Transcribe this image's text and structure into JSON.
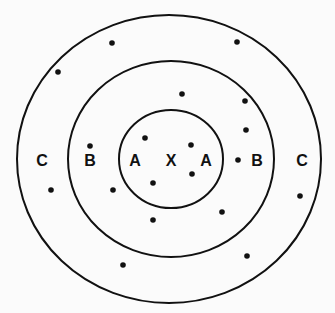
{
  "diagram": {
    "type": "concentric-zones",
    "stroke_color": "#111111",
    "background": "#fbfbfb",
    "rings": [
      {
        "name": "outer",
        "cx": 169,
        "cy": 159,
        "rx": 152,
        "ry": 144
      },
      {
        "name": "middle",
        "cx": 171,
        "cy": 159,
        "rx": 103,
        "ry": 98
      },
      {
        "name": "inner",
        "cx": 171,
        "cy": 159,
        "rx": 52,
        "ry": 49
      }
    ],
    "labels": [
      {
        "text": "C",
        "x": 42,
        "y": 160
      },
      {
        "text": "B",
        "x": 90,
        "y": 160
      },
      {
        "text": "A",
        "x": 135,
        "y": 160
      },
      {
        "text": "X",
        "x": 171,
        "y": 160
      },
      {
        "text": "A",
        "x": 206,
        "y": 160
      },
      {
        "text": "B",
        "x": 257,
        "y": 160
      },
      {
        "text": "C",
        "x": 302,
        "y": 160
      }
    ],
    "dots": [
      {
        "x": 112,
        "y": 43
      },
      {
        "x": 58,
        "y": 72
      },
      {
        "x": 237,
        "y": 42
      },
      {
        "x": 182,
        "y": 94
      },
      {
        "x": 245,
        "y": 101
      },
      {
        "x": 246,
        "y": 130
      },
      {
        "x": 145,
        "y": 138
      },
      {
        "x": 191,
        "y": 145
      },
      {
        "x": 90,
        "y": 146
      },
      {
        "x": 238,
        "y": 160
      },
      {
        "x": 192,
        "y": 174
      },
      {
        "x": 153,
        "y": 183
      },
      {
        "x": 51,
        "y": 190
      },
      {
        "x": 113,
        "y": 190
      },
      {
        "x": 222,
        "y": 212
      },
      {
        "x": 300,
        "y": 196
      },
      {
        "x": 153,
        "y": 220
      },
      {
        "x": 123,
        "y": 265
      },
      {
        "x": 247,
        "y": 256
      }
    ]
  }
}
